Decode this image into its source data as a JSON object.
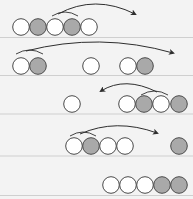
{
  "diagram": {
    "width": 193,
    "height": 199,
    "background": "#f3f3f3",
    "colors": {
      "white_fill": "#ffffff",
      "gray_fill": "#a9a9a9",
      "stroke": "#4a4a4a",
      "divider": "#cfcfcf",
      "arrow": "#2e2e2e"
    },
    "circle_radius": 8.3,
    "rows": [
      {
        "name": "step-1",
        "cy": 27,
        "divider_y": 37.5,
        "circles": [
          {
            "cx": 21,
            "state": "white"
          },
          {
            "cx": 38,
            "state": "gray"
          },
          {
            "cx": 55,
            "state": "white"
          },
          {
            "cx": 72,
            "state": "gray"
          },
          {
            "cx": 89,
            "state": "white"
          }
        ],
        "bracket": {
          "x1": 52,
          "x2": 78,
          "y": 16,
          "h": 4
        },
        "arrow": {
          "x1": 58,
          "y1": 14,
          "cx": 95,
          "cy": -6,
          "x2": 135,
          "y2": 14,
          "direction": "right"
        }
      },
      {
        "name": "step-2",
        "cy": 66,
        "divider_y": 75.5,
        "circles": [
          {
            "cx": 21,
            "state": "white"
          },
          {
            "cx": 38,
            "state": "gray"
          },
          {
            "cx": 91,
            "state": "white"
          },
          {
            "cx": 128,
            "state": "white"
          },
          {
            "cx": 145,
            "state": "gray"
          }
        ],
        "bracket": {
          "x1": 16,
          "x2": 43,
          "y": 54,
          "h": 4
        },
        "arrow": {
          "x1": 26,
          "y1": 51,
          "cx": 100,
          "cy": 32,
          "x2": 173,
          "y2": 53,
          "direction": "right"
        }
      },
      {
        "name": "step-3",
        "cy": 104,
        "divider_y": 114,
        "circles": [
          {
            "cx": 72,
            "state": "white"
          },
          {
            "cx": 127,
            "state": "white"
          },
          {
            "cx": 144,
            "state": "gray"
          },
          {
            "cx": 161,
            "state": "white"
          },
          {
            "cx": 179,
            "state": "gray"
          }
        ],
        "bracket": {
          "x1": 141,
          "x2": 168,
          "y": 95,
          "h": 4
        },
        "arrow": {
          "x1": 157,
          "y1": 92,
          "cx": 125,
          "cy": 76,
          "x2": 101,
          "y2": 91,
          "direction": "left"
        }
      },
      {
        "name": "step-4",
        "cy": 146,
        "divider_y": 156,
        "circles": [
          {
            "cx": 74,
            "state": "white"
          },
          {
            "cx": 91,
            "state": "gray"
          },
          {
            "cx": 108,
            "state": "white"
          },
          {
            "cx": 125,
            "state": "white"
          },
          {
            "cx": 179,
            "state": "gray"
          }
        ],
        "bracket": {
          "x1": 70,
          "x2": 96,
          "y": 136,
          "h": 4
        },
        "arrow": {
          "x1": 80,
          "y1": 134,
          "cx": 116,
          "cy": 118,
          "x2": 157,
          "y2": 133,
          "direction": "right"
        }
      },
      {
        "name": "step-5",
        "cy": 185,
        "divider_y": 195.5,
        "circles": [
          {
            "cx": 111,
            "state": "white"
          },
          {
            "cx": 128,
            "state": "white"
          },
          {
            "cx": 145,
            "state": "white"
          },
          {
            "cx": 162,
            "state": "gray"
          },
          {
            "cx": 179,
            "state": "gray"
          }
        ],
        "bracket": null,
        "arrow": null
      }
    ]
  }
}
